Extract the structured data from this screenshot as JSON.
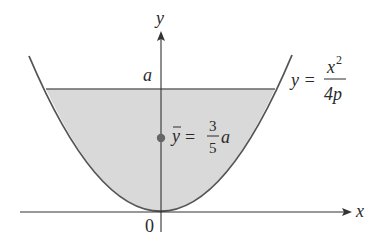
{
  "figure": {
    "colors": {
      "curve": "#555555",
      "axis": "#333333",
      "fill": "#d9d9d9",
      "level_line": "#666666",
      "centroid_dot": "#666666",
      "text": "#2a2a2a"
    },
    "axes": {
      "x_label": "x",
      "y_label": "y",
      "origin_label": "0"
    },
    "labels": {
      "level": "a",
      "curve_eq_lhs": "y =",
      "curve_eq_num": "x",
      "curve_eq_exp": "2",
      "curve_eq_den": "4p",
      "centroid_lhs": "y",
      "centroid_eq": "=",
      "centroid_num": "3",
      "centroid_den": "5",
      "centroid_var": "a"
    }
  }
}
